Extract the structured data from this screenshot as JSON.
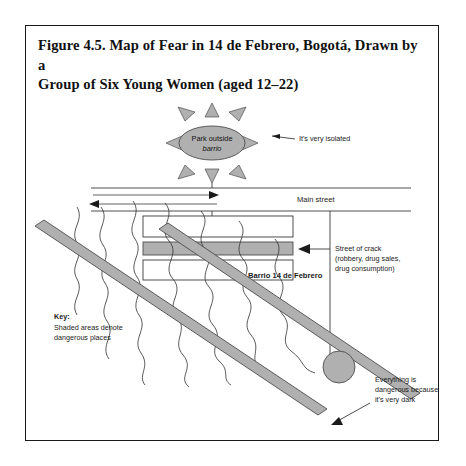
{
  "figure": {
    "title": "Figure 4.5. Map of Fear in 14 de Febrero, Bogotá, Drawn by a Group of Six Young Women (aged 12–22)",
    "title_line1": "Figure 4.5. Map of Fear in 14 de Febrero, Bogotá, Drawn by a",
    "title_line2": "Group of Six Young Women (aged 12–22)"
  },
  "map": {
    "park": {
      "label_line1": "Park outside",
      "label_line2": "barrio"
    },
    "street_label": "Main street",
    "barrio_label": "Barrio 14 de Febrero",
    "callouts": [
      {
        "id": "isolated",
        "lines": [
          "It's very isolated"
        ]
      },
      {
        "id": "street-of-crack",
        "lines": [
          "Street of crack",
          "(robbery, drug sales,",
          "drug consumption)"
        ]
      },
      {
        "id": "very-dark",
        "lines": [
          "Everything is",
          "dangerous because",
          "it's very dark"
        ]
      }
    ],
    "key": {
      "heading": "Key:",
      "line1": "Shaded areas denote",
      "line2": "dangerous places"
    }
  },
  "colors": {
    "shaded_fill": "#b0b0b0",
    "shaded_stroke": "#4d4d4d",
    "line": "#3a3a3a",
    "frame": "#1a1a1a",
    "text": "#111111",
    "page_background": "#ffffff"
  }
}
